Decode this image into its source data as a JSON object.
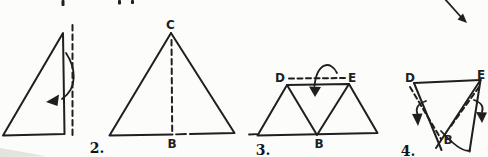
{
  "theme": {
    "paper": "#fcfcfa",
    "ink": "#1f1f1f"
  },
  "figures": {
    "step1": {
      "number": "",
      "icons": {
        "fold_arrow": "curved-fold-left-arrow"
      }
    },
    "step2": {
      "number": "2.",
      "labels": {
        "apex": "C",
        "base": "B"
      }
    },
    "step3": {
      "number": "3.",
      "labels": {
        "left": "D",
        "right": "E",
        "bottom": "B"
      },
      "icons": {
        "fold_arrow": "curved-fold-down-arrow"
      }
    },
    "step4": {
      "number": "4.",
      "labels": {
        "left": "D",
        "right": "E",
        "bottom": "B"
      },
      "icons": {
        "fold_arrow_left": "curved-fold-down-arrow",
        "fold_arrow_right": "curved-fold-down-arrow"
      }
    }
  },
  "artifacts": {
    "page_edge_arrow": "diagonal-down-right-arrow",
    "cropped_top_text": "partial glyph fragments"
  }
}
